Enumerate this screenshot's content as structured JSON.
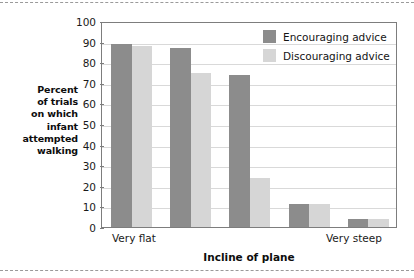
{
  "chart_data": {
    "type": "bar",
    "title": "",
    "xlabel": "Incline of plane",
    "ylabel": "Percent of trials on which infant attempted walking",
    "ylim": [
      0,
      100
    ],
    "ytick_step": 10,
    "yticks": [
      "100",
      "90",
      "80",
      "70",
      "60",
      "50",
      "40",
      "30",
      "20",
      "10",
      "0"
    ],
    "grid": true,
    "legend_position": "top-right",
    "categories": [
      "",
      "",
      "",
      "",
      ""
    ],
    "xtick_labels": [
      "Very flat",
      "Very steep"
    ],
    "series": [
      {
        "name": "Encouraging advice",
        "color": "#8c8c8c",
        "values": [
          89,
          87,
          74,
          11,
          4
        ]
      },
      {
        "name": "Discouraging advice",
        "color": "#d6d6d6",
        "values": [
          88,
          75,
          24,
          11,
          4
        ]
      }
    ]
  },
  "axes": {
    "y_title_lines": [
      "Percent",
      "of trials",
      "on which",
      "infant",
      "attempted",
      "walking"
    ],
    "x_title": "Incline of plane",
    "x_left_label": "Very flat",
    "x_right_label": "Very steep"
  },
  "legend": {
    "items": [
      {
        "label": "Encouraging advice",
        "color": "#8c8c8c"
      },
      {
        "label": "Discouraging advice",
        "color": "#d6d6d6"
      }
    ]
  },
  "colors": {
    "encouraging": "#8c8c8c",
    "discouraging": "#d6d6d6",
    "frame": "#7d7d7d",
    "gridline": "#d9d9d9",
    "background": "#ffffff",
    "dashed_edge": "#9a9a9a"
  }
}
